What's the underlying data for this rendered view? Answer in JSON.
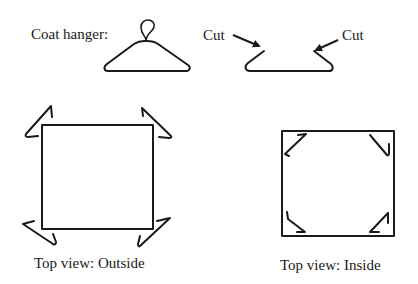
{
  "figure": {
    "hanger_label": "Coat hanger:",
    "cut_left_label": "Cut",
    "cut_right_label": "Cut",
    "outside_caption": "Top view: Outside",
    "inside_caption": "Top view: Inside"
  },
  "colors": {
    "ink": "#1a1a1a",
    "background": "#ffffff"
  }
}
